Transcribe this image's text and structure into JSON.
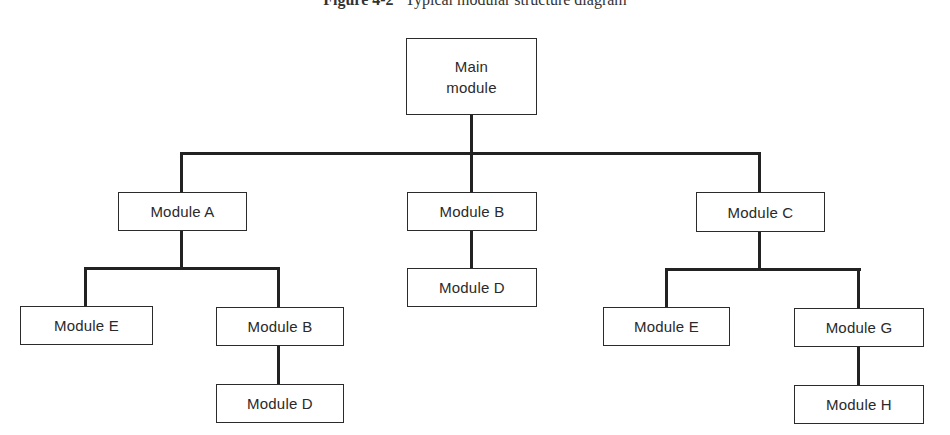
{
  "figure": {
    "label": "Figure 4-2",
    "title": "Typical modular structure diagram"
  },
  "diagram": {
    "type": "hierarchy",
    "root": {
      "id": "main",
      "label_line1": "Main",
      "label_line2": "module"
    },
    "nodes": {
      "module_a": "Module A",
      "module_b_center": "Module B",
      "module_c": "Module C",
      "module_d_center": "Module D",
      "module_e_left": "Module E",
      "module_b_lower": "Module B",
      "module_d_lower": "Module D",
      "module_e_right": "Module E",
      "module_g": "Module G",
      "module_h": "Module H"
    },
    "edges": [
      [
        "Main module",
        "Module A"
      ],
      [
        "Main module",
        "Module B"
      ],
      [
        "Main module",
        "Module C"
      ],
      [
        "Module B",
        "Module D"
      ],
      [
        "Module A",
        "Module E"
      ],
      [
        "Module A",
        "Module B"
      ],
      [
        "Module B",
        "Module D"
      ],
      [
        "Module C",
        "Module E"
      ],
      [
        "Module C",
        "Module G"
      ],
      [
        "Module G",
        "Module H"
      ]
    ],
    "colors": {
      "line": "#222222",
      "box_border": "#2b2b2b",
      "text": "#2a2a2a",
      "background": "#ffffff"
    }
  }
}
